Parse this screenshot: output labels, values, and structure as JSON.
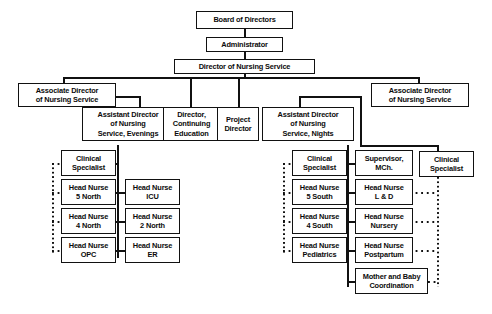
{
  "diagram": {
    "type": "organizational-chart",
    "background_color": "#ffffff",
    "line_color": "#111111",
    "text_color": "#0b0b0b"
  },
  "nodes": {
    "board_of_directors": "Board of Directors",
    "administrator": "Administrator",
    "director_of_nursing_service": "Director of Nursing Service",
    "associate_director_left": "Associate Director\nof Nursing Service",
    "associate_director_right": "Associate Director\nof Nursing Service",
    "assistant_director_evenings": "Assistant Director\nof Nursing\nService, Evenings",
    "director_continuing_education": "Director,\nContinuing\nEducation",
    "project_director": "Project\nDirector",
    "assistant_director_nights": "Assistant Director\nof Nursing\nService, Nights",
    "clinical_specialist_evenings": "Clinical\nSpecialist",
    "head_nurse_5_north": "Head Nurse\n5 North",
    "head_nurse_4_north": "Head Nurse\n4 North",
    "head_nurse_opc": "Head Nurse\nOPC",
    "head_nurse_icu": "Head Nurse\nICU",
    "head_nurse_2_north": "Head Nurse\n2 North",
    "head_nurse_er": "Head Nurse\nER",
    "clinical_specialist_nights": "Clinical\nSpecialist",
    "head_nurse_5_south": "Head Nurse\n5 South",
    "head_nurse_4_south": "Head Nurse\n4 South",
    "head_nurse_pediatrics": "Head Nurse\nPediatrics",
    "supervisor_mch": "Supervisor,\nMCh.",
    "head_nurse_l_and_d": "Head Nurse\nL & D",
    "head_nurse_nursery": "Head Nurse\nNursery",
    "head_nurse_postpartum": "Head Nurse\nPostpartum",
    "mother_and_baby_coordination": "Mother and Baby\nCoordination",
    "clinical_specialist_mch": "Clinical\nSpecialist"
  }
}
